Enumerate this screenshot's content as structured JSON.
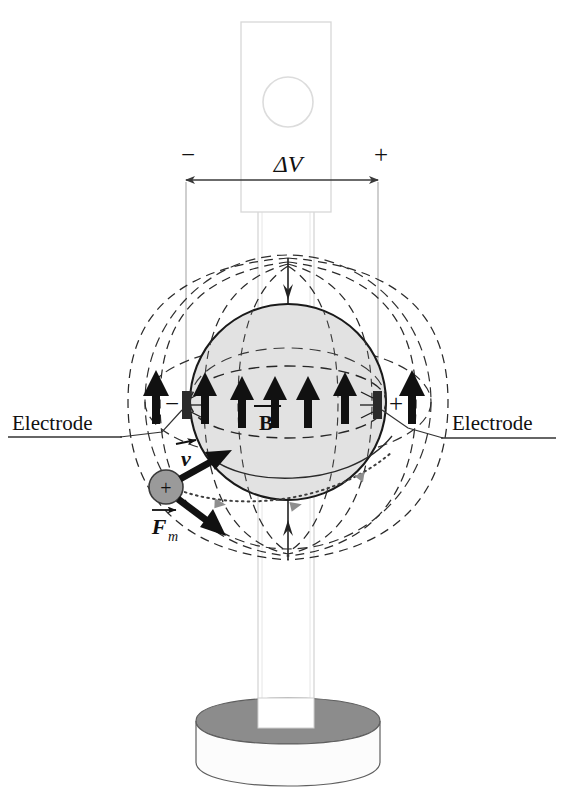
{
  "figure": {
    "type": "physics-diagram"
  },
  "labels": {
    "electrode_left": "Electrode",
    "electrode_right": "Electrode",
    "potential_difference": "ΔV",
    "sign_negative": "−",
    "sign_positive": "+",
    "electrode_sign_left": "−",
    "electrode_sign_right": "+",
    "magnetic_field": "B",
    "velocity": "v",
    "magnetic_force": "F",
    "magnetic_force_subscript": "m",
    "particle_charge": "+"
  },
  "colors": {
    "sphere_fill": "#e2e2e2",
    "sphere_stroke": "#1a1a1a",
    "field_line_stroke": "#262626",
    "electrode_fill": "#2b2b2b",
    "arrow_fill": "#111111",
    "particle_fill": "#9a9a9a",
    "particle_stroke": "#3a3a3a",
    "column_fill": "#ffffff",
    "column_stroke": "#cfcfcf",
    "base_top_fill": "#8c8c8c",
    "base_front_fill": "#fcfcfc",
    "base_stroke": "#5f5f5f",
    "dimension_line": "#9a9a9a",
    "trajectory_stroke": "#3d3d3d",
    "trajectory_arrow": "#8e8e8e",
    "background": "#ffffff"
  },
  "geometry": {
    "sphere_center_x": 288,
    "sphere_center_y": 402,
    "sphere_radius": 98,
    "electrode_left_x": 186,
    "electrode_right_x": 378,
    "electrode_y": 405,
    "dimension_arrow_y": 180,
    "field_arrow_count": 7,
    "outer_shell_rx": 143,
    "outer_shell_ry": 147
  },
  "field_arrows": [
    {
      "x": 156,
      "inside": false
    },
    {
      "x": 205,
      "inside": true
    },
    {
      "x": 242,
      "inside": true
    },
    {
      "x": 275,
      "inside": true
    },
    {
      "x": 308,
      "inside": true
    },
    {
      "x": 345,
      "inside": true
    },
    {
      "x": 412,
      "inside": false
    }
  ],
  "components": {
    "top_instrument": "voltage-source-box",
    "top_instrument_dial": "circular-dial",
    "column": "vertical-support-column",
    "base": "cylindrical-pedestal-base",
    "sphere": "magnetized-sphere",
    "particle": "positive-charged-particle"
  }
}
